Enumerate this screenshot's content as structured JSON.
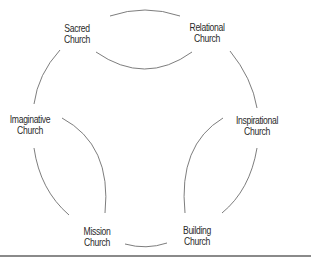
{
  "diagram": {
    "nodes": [
      {
        "id": "sacred",
        "line1": "Sacred",
        "line2": "Church",
        "x": 77,
        "y": 34
      },
      {
        "id": "relational",
        "line1": "Relational",
        "line2": "Church",
        "x": 207,
        "y": 33
      },
      {
        "id": "imaginative",
        "line1": "Imaginative",
        "line2": "Church",
        "x": 30,
        "y": 125
      },
      {
        "id": "inspirational",
        "line1": "Inspirational",
        "line2": "Church",
        "x": 257,
        "y": 126
      },
      {
        "id": "mission",
        "line1": "Mission",
        "line2": "Church",
        "x": 97,
        "y": 237
      },
      {
        "id": "building",
        "line1": "Building",
        "line2": "Church",
        "x": 197,
        "y": 236
      }
    ],
    "connections": [
      {
        "from": "Sacred Church",
        "to": "Relational Church",
        "type": "outer-arc"
      },
      {
        "from": "Sacred Church",
        "to": "Relational Church",
        "type": "inner-arc"
      },
      {
        "from": "Sacred Church",
        "to": "Imaginative Church",
        "type": "outer-arc"
      },
      {
        "from": "Relational Church",
        "to": "Inspirational Church",
        "type": "outer-arc"
      },
      {
        "from": "Imaginative Church",
        "to": "Mission Church",
        "type": "inner-arc"
      },
      {
        "from": "Imaginative Church",
        "to": "Mission Church",
        "type": "outer-arc"
      },
      {
        "from": "Inspirational Church",
        "to": "Building Church",
        "type": "inner-arc"
      },
      {
        "from": "Inspirational Church",
        "to": "Building Church",
        "type": "outer-arc"
      },
      {
        "from": "Mission Church",
        "to": "Building Church",
        "type": "outer-arc"
      }
    ],
    "colors": {
      "stroke": "#6e6e6e",
      "text": "#2a2a2a",
      "baseline": "#8a8a8a"
    }
  }
}
